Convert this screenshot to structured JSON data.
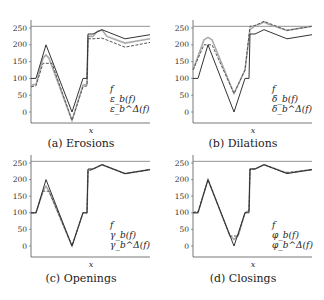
{
  "chart_data": [
    {
      "type": "line",
      "title": "(a) Erosions",
      "xlabel": "x",
      "ylabel": "",
      "ylim": [
        -30,
        270
      ],
      "yticks": [
        0,
        50,
        100,
        150,
        200,
        250
      ],
      "reference_line": 255,
      "legend": [
        "f",
        "ε_b(f)",
        "ε_b^Δ(f)"
      ],
      "legend_position": "lower right",
      "series": [
        {
          "name": "f",
          "style": "solid",
          "color": "#333333",
          "x": [
            0,
            5,
            15,
            41,
            52,
            56,
            57,
            62,
            71,
            94,
            119
          ],
          "y": [
            100,
            100,
            200,
            0,
            100,
            100,
            232,
            232,
            245,
            218,
            230
          ]
        },
        {
          "name": "ε_b(f)",
          "style": "dashed",
          "color": "#555555",
          "x": [
            0,
            5,
            12,
            16,
            21,
            41,
            52,
            56,
            57,
            62,
            71,
            94,
            119
          ],
          "y": [
            75,
            78,
            145,
            145,
            145,
            -25,
            75,
            78,
            218,
            218,
            220,
            193,
            207
          ]
        },
        {
          "name": "ε_b^Δ(f)",
          "style": "solid",
          "color": "#aaaaaa",
          "x": [
            0,
            5,
            12,
            15,
            18,
            41,
            52,
            56,
            57,
            62,
            66,
            71,
            76,
            94,
            119
          ],
          "y": [
            80,
            82,
            160,
            170,
            160,
            -25,
            80,
            82,
            225,
            225,
            240,
            244,
            225,
            205,
            218
          ]
        }
      ]
    },
    {
      "type": "line",
      "title": "(b) Dilations",
      "xlabel": "x",
      "ylabel": "",
      "ylim": [
        -30,
        270
      ],
      "yticks": [
        0,
        50,
        100,
        150,
        200,
        250
      ],
      "reference_line": 255,
      "legend": [
        "f",
        "δ_b(f)",
        "δ_b^Δ(f)"
      ],
      "legend_position": "lower right",
      "series": [
        {
          "name": "f",
          "style": "solid",
          "color": "#333333",
          "x": [
            0,
            5,
            15,
            41,
            52,
            56,
            57,
            62,
            71,
            94,
            119
          ],
          "y": [
            100,
            100,
            200,
            0,
            100,
            100,
            232,
            232,
            245,
            218,
            230
          ]
        },
        {
          "name": "δ_b(f)",
          "style": "dashed",
          "color": "#555555",
          "x": [
            0,
            11,
            19,
            41,
            52,
            57,
            62,
            71,
            94,
            119
          ],
          "y": [
            125,
            200,
            200,
            55,
            125,
            255,
            257,
            270,
            243,
            255
          ]
        },
        {
          "name": "δ_b^Δ(f)",
          "style": "solid",
          "color": "#aaaaaa",
          "x": [
            0,
            11,
            15,
            19,
            41,
            52,
            57,
            62,
            67,
            71,
            75,
            94,
            119
          ],
          "y": [
            125,
            215,
            222,
            215,
            55,
            125,
            245,
            257,
            262,
            268,
            262,
            243,
            255
          ]
        }
      ]
    },
    {
      "type": "line",
      "title": "(c) Openings",
      "xlabel": "x",
      "ylabel": "",
      "ylim": [
        -30,
        270
      ],
      "yticks": [
        0,
        50,
        100,
        150,
        200,
        250
      ],
      "reference_line": 255,
      "legend": [
        "f",
        "γ_b(f)",
        "γ_b^Δ(f)"
      ],
      "legend_position": "lower right",
      "series": [
        {
          "name": "f",
          "style": "solid",
          "color": "#333333",
          "x": [
            0,
            5,
            15,
            41,
            52,
            56,
            57,
            62,
            71,
            94,
            119
          ],
          "y": [
            100,
            100,
            200,
            0,
            100,
            100,
            232,
            232,
            245,
            218,
            230
          ]
        },
        {
          "name": "γ_b(f)",
          "style": "dashed",
          "color": "#555555",
          "x": [
            0,
            5,
            12,
            18,
            41,
            52,
            56,
            57,
            62,
            71,
            94,
            119
          ],
          "y": [
            100,
            100,
            165,
            165,
            0,
            100,
            100,
            225,
            232,
            245,
            218,
            230
          ]
        },
        {
          "name": "γ_b^Δ(f)",
          "style": "solid",
          "color": "#aaaaaa",
          "x": [
            0,
            5,
            12,
            15,
            18,
            41,
            52,
            56,
            57,
            62,
            71,
            94,
            119
          ],
          "y": [
            100,
            100,
            165,
            180,
            165,
            0,
            100,
            100,
            228,
            232,
            245,
            218,
            230
          ]
        }
      ]
    },
    {
      "type": "line",
      "title": "(d) Closings",
      "xlabel": "x",
      "ylabel": "",
      "ylim": [
        -30,
        270
      ],
      "yticks": [
        0,
        50,
        100,
        150,
        200,
        250
      ],
      "reference_line": 255,
      "legend": [
        "f",
        "φ_b(f)",
        "φ_b^Δ(f)"
      ],
      "legend_position": "lower right",
      "series": [
        {
          "name": "f",
          "style": "solid",
          "color": "#333333",
          "x": [
            0,
            5,
            15,
            41,
            52,
            56,
            57,
            62,
            71,
            94,
            119
          ],
          "y": [
            100,
            100,
            200,
            0,
            100,
            100,
            232,
            232,
            245,
            218,
            230
          ]
        },
        {
          "name": "φ_b(f)",
          "style": "dashed",
          "color": "#555555",
          "x": [
            0,
            2,
            5,
            15,
            37,
            45,
            52,
            56,
            57,
            62,
            71,
            91,
            97,
            119
          ],
          "y": [
            100,
            103,
            103,
            200,
            30,
            30,
            100,
            108,
            232,
            232,
            245,
            222,
            222,
            230
          ]
        },
        {
          "name": "φ_b^Δ(f)",
          "style": "solid",
          "color": "#aaaaaa",
          "x": [
            0,
            5,
            15,
            37,
            41,
            45,
            52,
            56,
            57,
            62,
            71,
            94,
            119
          ],
          "y": [
            100,
            100,
            200,
            30,
            20,
            30,
            100,
            105,
            232,
            232,
            245,
            220,
            230
          ]
        }
      ]
    }
  ],
  "panels": [
    {
      "caption": "(a) Erosions",
      "xlabel": "x",
      "legend": [
        "f",
        "ε_b(f)",
        "ε_b^Δ(f)"
      ]
    },
    {
      "caption": "(b) Dilations",
      "xlabel": "x",
      "legend": [
        "f",
        "δ_b(f)",
        "δ_b^Δ(f)"
      ]
    },
    {
      "caption": "(c) Openings",
      "xlabel": "x",
      "legend": [
        "f",
        "γ_b(f)",
        "γ_b^Δ(f)"
      ]
    },
    {
      "caption": "(d) Closings",
      "xlabel": "x",
      "legend": [
        "f",
        "φ_b(f)",
        "φ_b^Δ(f)"
      ]
    }
  ]
}
